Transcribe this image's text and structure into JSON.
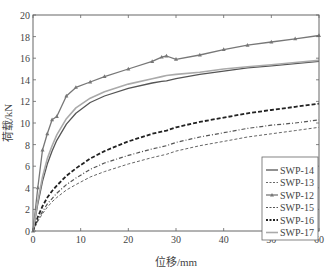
{
  "chart_data": {
    "type": "line",
    "title": "",
    "xlabel": "位移/mm",
    "ylabel": "荷载/kN",
    "xlim": [
      0,
      60
    ],
    "ylim": [
      0,
      20
    ],
    "xticks": [
      0,
      10,
      20,
      30,
      40,
      50,
      60
    ],
    "yticks": [
      0,
      2,
      4,
      6,
      8,
      10,
      12,
      14,
      16,
      18,
      20
    ],
    "grid": false,
    "legend_position": "lower right",
    "x": [
      0,
      1,
      2,
      3,
      4,
      5,
      7,
      9,
      12,
      15,
      20,
      25,
      27,
      28,
      30,
      35,
      40,
      45,
      50,
      55,
      60
    ],
    "series": [
      {
        "name": "SWP-14",
        "style": "solid",
        "color": "#555555",
        "values": [
          0,
          2.5,
          4.6,
          6.2,
          7.4,
          8.4,
          9.9,
          10.9,
          11.9,
          12.5,
          13.2,
          13.7,
          13.85,
          13.9,
          14.1,
          14.5,
          14.8,
          15.1,
          15.3,
          15.5,
          15.7
        ]
      },
      {
        "name": "SWP-13",
        "style": "dashed",
        "color": "#666666",
        "values": [
          0,
          0.9,
          1.6,
          2.2,
          2.7,
          3.1,
          3.8,
          4.3,
          5.0,
          5.5,
          6.2,
          6.8,
          7.0,
          7.1,
          7.4,
          7.9,
          8.3,
          8.7,
          9.0,
          9.3,
          9.6
        ]
      },
      {
        "name": "SWP-12",
        "style": "solid-triangle-markers",
        "color": "#777777",
        "values": [
          0,
          4.0,
          7.5,
          9.0,
          10.3,
          10.6,
          12.5,
          13.3,
          13.8,
          14.3,
          15.0,
          15.7,
          16.1,
          16.2,
          15.9,
          16.3,
          16.8,
          17.2,
          17.5,
          17.8,
          18.1
        ]
      },
      {
        "name": "SWP-15",
        "style": "dash-dot-markers",
        "color": "#555555",
        "values": [
          0,
          1.0,
          1.8,
          2.5,
          3.0,
          3.5,
          4.3,
          4.9,
          5.7,
          6.3,
          7.0,
          7.6,
          7.8,
          7.9,
          8.2,
          8.7,
          9.1,
          9.5,
          9.8,
          10.0,
          10.3
        ]
      },
      {
        "name": "SWP-16",
        "style": "dash-circle-markers",
        "color": "#222222",
        "values": [
          0,
          1.3,
          2.3,
          3.1,
          3.7,
          4.2,
          5.1,
          5.8,
          6.7,
          7.4,
          8.3,
          9.0,
          9.2,
          9.3,
          9.6,
          10.1,
          10.5,
          10.9,
          11.2,
          11.5,
          11.8
        ]
      },
      {
        "name": "SWP-17",
        "style": "solid-light-markers",
        "color": "#aaaaaa",
        "values": [
          0,
          2.8,
          5.0,
          6.7,
          7.9,
          8.9,
          10.4,
          11.4,
          12.3,
          12.9,
          13.6,
          14.1,
          14.3,
          14.4,
          14.5,
          14.7,
          15.0,
          15.2,
          15.4,
          15.6,
          15.8
        ]
      }
    ]
  }
}
